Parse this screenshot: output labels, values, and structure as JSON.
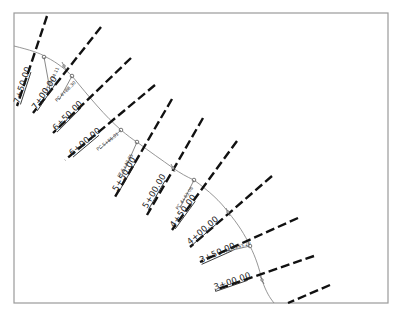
{
  "drawing": {
    "type": "road alignment plan with cross-section station lines",
    "frame": {
      "x": 14,
      "y": 13,
      "width": 374,
      "height": 290,
      "stroke": "#9a9a9a"
    },
    "alignment": {
      "stroke": "#8a8a8a",
      "path": "M14,46 C30,50 40,53 46,57 C58,63 66,70 72,76 C90,98 105,116 121,130 C127,135 132,139 137,142 C150,152 162,160 173,168 C180,173 187,177 194,180 C210,192 220,201 228,212 C238,224 245,235 250,246 C256,258 259,268 262,280 C266,292 270,298 274,303"
    },
    "sections": [
      {
        "label": "7+50.00",
        "x1": 47,
        "y1": 16,
        "x2": 17,
        "y2": 106,
        "lx": 19,
        "ly": 104,
        "angle": -72
      },
      {
        "label": "7+00.00",
        "x1": 101,
        "y1": 27,
        "x2": 33,
        "y2": 113,
        "lx": 36,
        "ly": 110,
        "angle": -56
      },
      {
        "label": "6+50.00",
        "x1": 131,
        "y1": 58,
        "x2": 53,
        "y2": 133,
        "lx": 56,
        "ly": 131,
        "angle": -45
      },
      {
        "label": "6+00.00",
        "x1": 155,
        "y1": 85,
        "x2": 65,
        "y2": 160,
        "lx": 72,
        "ly": 156,
        "angle": -40
      },
      {
        "label": "5+50.00",
        "x1": 172,
        "y1": 99,
        "x2": 115,
        "y2": 197,
        "lx": 117,
        "ly": 192,
        "angle": -60
      },
      {
        "label": "5+00.00",
        "x1": 203,
        "y1": 118,
        "x2": 147,
        "y2": 215,
        "lx": 147,
        "ly": 209,
        "angle": -60
      },
      {
        "label": "4+50.00",
        "x1": 237,
        "y1": 141,
        "x2": 172,
        "y2": 230,
        "lx": 174,
        "ly": 228,
        "angle": -54
      },
      {
        "label": "4+00.00",
        "x1": 272,
        "y1": 176,
        "x2": 190,
        "y2": 247,
        "lx": 190,
        "ly": 245,
        "angle": -41
      },
      {
        "label": "3+50.00",
        "x1": 298,
        "y1": 218,
        "x2": 200,
        "y2": 262,
        "lx": 201,
        "ly": 263,
        "angle": -24
      },
      {
        "label": "3+00.00",
        "x1": 314,
        "y1": 256,
        "x2": 215,
        "y2": 290,
        "lx": 215,
        "ly": 290,
        "angle": -19
      },
      {
        "label": "",
        "x1": 330,
        "y1": 285,
        "x2": 288,
        "y2": 303,
        "lx": 0,
        "ly": 0,
        "angle": 0
      }
    ],
    "curve_points": [
      {
        "name": "PT",
        "label": "PT 7+34.11",
        "x": 44,
        "y": 57,
        "lx": 48,
        "ly": 92,
        "angle": -65
      },
      {
        "name": "PC",
        "label": "PC 6+88.30",
        "x": 72,
        "y": 76,
        "lx": 57,
        "ly": 102,
        "angle": -45
      },
      {
        "name": "PC",
        "label": "PC 5+86.01",
        "x": 121,
        "y": 130,
        "lx": 98,
        "ly": 151,
        "angle": -38
      },
      {
        "name": "PT",
        "label": "PT 5+43.85",
        "x": 137,
        "y": 142,
        "lx": 120,
        "ly": 178,
        "angle": -60
      },
      {
        "name": "PC",
        "label": "PC 4+63.06",
        "x": 194,
        "y": 180,
        "lx": 178,
        "ly": 210,
        "angle": -55
      },
      {
        "name": "PT",
        "label": "PT 3+43.20",
        "x": 250,
        "y": 246,
        "lx": 226,
        "ly": 253,
        "angle": -20
      }
    ],
    "alignment_ticks": [
      {
        "x": 64,
        "y": 66
      },
      {
        "x": 173,
        "y": 168
      },
      {
        "x": 228,
        "y": 212
      },
      {
        "x": 262,
        "y": 280
      }
    ],
    "top_edge_fragments": "partially cut-off text along top edge"
  }
}
